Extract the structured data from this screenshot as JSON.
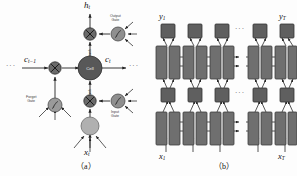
{
  "figure": {
    "panels": [
      {
        "id": "a",
        "caption": "（a）",
        "kind": "lstm-cell-diagram",
        "nodes": {
          "cell": {
            "label": "Cell",
            "fill": "#585858"
          },
          "input_node": {
            "label": "",
            "fill": "#b0b0b0"
          },
          "forget_gate": {
            "label": "Forget\nGate",
            "label_line1": "Forget",
            "label_line2": "Gate",
            "glyph": "sigmoid",
            "fill": "#9a9a9a"
          },
          "input_gate": {
            "label_line1": "Input",
            "label_line2": "Gate",
            "glyph": "sigmoid",
            "fill": "#8f8f8f"
          },
          "output_gate": {
            "label_line1": "Output",
            "label_line2": "Gate",
            "glyph": "sigmoid",
            "fill": "#8f8f8f"
          },
          "mult_left": {
            "glyph": "times",
            "fill": "#6a6a6a"
          },
          "mult_top": {
            "glyph": "times",
            "fill": "#6a6a6a"
          },
          "mult_bottom": {
            "glyph": "times",
            "fill": "#6a6a6a"
          }
        },
        "labels": {
          "h_t": "h",
          "h_t_sub": "t",
          "c_prev": "c",
          "c_prev_sub": "t−1",
          "c_t": "c",
          "c_t_sub": "t",
          "x_t": "x",
          "x_t_sub": "t",
          "tanh_up": "tanh",
          "tanh_down": "tanh",
          "ellipsis_left": "···",
          "ellipsis_right": "···"
        }
      },
      {
        "id": "b",
        "caption": "（b）",
        "kind": "stacked-bidirectional-rnn",
        "labels": {
          "y_1": "y",
          "y_1_sub": "1",
          "y_T": "y",
          "y_T_sub": "T",
          "x_1": "x",
          "x_1_sub": "1",
          "x_T": "x",
          "x_T_sub": "T",
          "ellipsis_top": "···",
          "ellipsis_mid": "···",
          "ellipsis_upper_row": "···",
          "ellipsis_lower_row": "···"
        },
        "colors": {
          "block_fill": "#6f6f6f",
          "block_stroke": "#3c3c3c",
          "square_fill": "#5f5f5f",
          "square_stroke": "#343434",
          "line": "#2a2a2a"
        },
        "columns": 5,
        "timesteps": [
          "1",
          "2",
          "3",
          "T-1",
          "T"
        ]
      }
    ]
  }
}
